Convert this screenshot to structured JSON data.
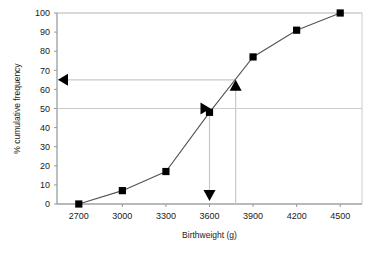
{
  "chart_data": {
    "type": "line",
    "title": "",
    "xlabel": "Birthweight (g)",
    "ylabel": "% cumulative frequency",
    "xlim": [
      2550,
      4650
    ],
    "ylim": [
      0,
      100
    ],
    "xticks": [
      2700,
      3000,
      3300,
      3600,
      3900,
      4200,
      4500
    ],
    "yticks": [
      0,
      10,
      20,
      30,
      40,
      50,
      60,
      70,
      80,
      90,
      100
    ],
    "gridlines_y": [
      0,
      50,
      100
    ],
    "grid": true,
    "legend": "none",
    "marker": "square",
    "x": [
      2700,
      3000,
      3300,
      3600,
      3900,
      4200,
      4500
    ],
    "values": [
      0,
      7,
      17,
      48,
      77,
      91,
      100
    ],
    "series": [
      {
        "name": "% cumulative frequency",
        "x": [
          2700,
          3000,
          3300,
          3600,
          3900,
          4200,
          4500
        ],
        "values": [
          0,
          7,
          17,
          48,
          77,
          91,
          100
        ]
      }
    ],
    "annotations": [
      {
        "name": "median-readoff",
        "type": "arrow-path",
        "from_y": 50,
        "to_x": 3600,
        "marker": "right-arrow-and-down-arrow",
        "description": "Horizontal line at 50% to curve, then vertical drop to 3600 g"
      },
      {
        "name": "percentile-readoff",
        "type": "arrow-path",
        "from_x": 3780,
        "to_y": 65,
        "marker": "up-arrow-and-left-arrow",
        "description": "Vertical line up from 3780 g to curve, then horizontal to 65%"
      }
    ]
  },
  "ticks": {
    "x": [
      "2700",
      "3000",
      "3300",
      "3600",
      "3900",
      "4200",
      "4500"
    ],
    "y": [
      "0",
      "10",
      "20",
      "30",
      "40",
      "50",
      "60",
      "70",
      "80",
      "90",
      "100"
    ]
  },
  "axis_titles": {
    "x": "Birthweight (g)",
    "y": "% cumulative frequency"
  },
  "colors": {
    "line": "#555555",
    "marker": "#000000",
    "grid": "#cccccc",
    "axis": "#999999",
    "annotation": "#c8c8c8",
    "arrow": "#000000",
    "background": "#ffffff"
  }
}
